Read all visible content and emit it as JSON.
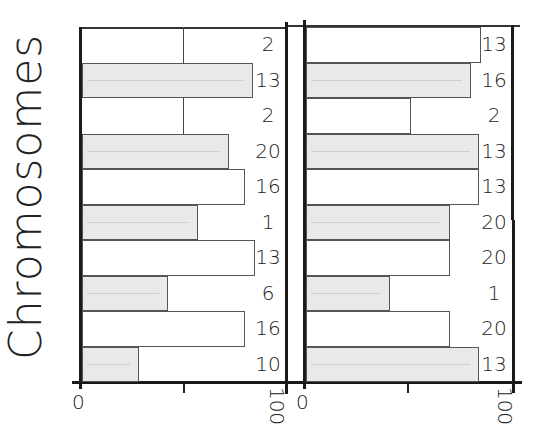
{
  "chart_data": {
    "type": "bar",
    "orientation": "horizontal",
    "style": "hand-drawn",
    "ylabel": "Chromosomes",
    "xlim": [
      0,
      100
    ],
    "x_tick_labels": [
      "0",
      "100"
    ],
    "panels": [
      {
        "name": "left",
        "rows": [
          {
            "count": "2",
            "value": 50,
            "style": "line"
          },
          {
            "count": "13",
            "value": 84,
            "style": "shaded"
          },
          {
            "count": "2",
            "value": 50,
            "style": "line"
          },
          {
            "count": "20",
            "value": 72,
            "style": "shaded"
          },
          {
            "count": "16",
            "value": 80,
            "style": "open"
          },
          {
            "count": "1",
            "value": 57,
            "style": "shaded"
          },
          {
            "count": "13",
            "value": 85,
            "style": "open"
          },
          {
            "count": "6",
            "value": 42,
            "style": "shaded"
          },
          {
            "count": "16",
            "value": 80,
            "style": "open"
          },
          {
            "count": "10",
            "value": 28,
            "style": "shaded"
          }
        ]
      },
      {
        "name": "right",
        "rows": [
          {
            "count": "13",
            "value": 85,
            "style": "open"
          },
          {
            "count": "16",
            "value": 80,
            "style": "shaded"
          },
          {
            "count": "2",
            "value": 51,
            "style": "open"
          },
          {
            "count": "13",
            "value": 84,
            "style": "shaded"
          },
          {
            "count": "13",
            "value": 84,
            "style": "open"
          },
          {
            "count": "20",
            "value": 70,
            "style": "shaded"
          },
          {
            "count": "20",
            "value": 70,
            "style": "open"
          },
          {
            "count": "1",
            "value": 41,
            "style": "shaded"
          },
          {
            "count": "20",
            "value": 70,
            "style": "open"
          },
          {
            "count": "13",
            "value": 84,
            "style": "shaded"
          }
        ]
      }
    ]
  }
}
